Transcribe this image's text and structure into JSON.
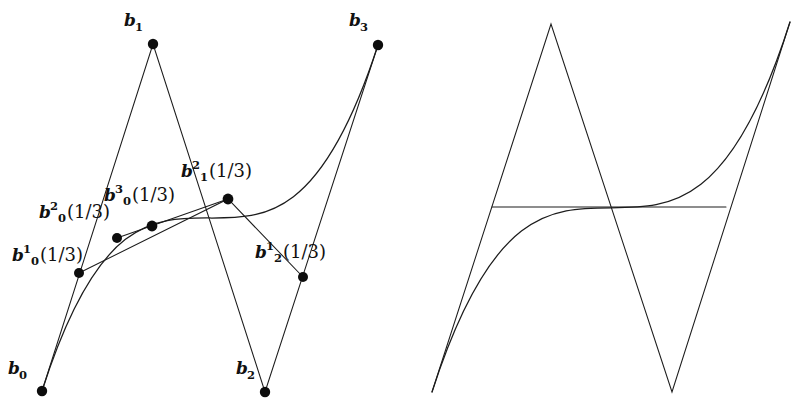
{
  "figure": {
    "background_color": "#ffffff",
    "stroke_color": "#1c1c1c",
    "dot_color": "#0d0d0d",
    "parameter_label": "1/3"
  },
  "left_panel": {
    "name": "labelled-de-casteljau-construction",
    "control_points": [
      {
        "id": "b0",
        "label_base": "b",
        "sub": "0",
        "sup": "",
        "arg": "",
        "x": 42,
        "y": 391
      },
      {
        "id": "b1",
        "label_base": "b",
        "sub": "1",
        "sup": "",
        "arg": "",
        "x": 153,
        "y": 44
      },
      {
        "id": "b2",
        "label_base": "b",
        "sub": "2",
        "sup": "",
        "arg": "",
        "x": 265,
        "y": 392
      },
      {
        "id": "b3",
        "label_base": "b",
        "sub": "3",
        "sup": "",
        "arg": "",
        "x": 378,
        "y": 45
      }
    ],
    "intermediate_points": [
      {
        "id": "b0_1",
        "label_base": "b",
        "sub": "0",
        "sup": "1",
        "arg": "(1/3)",
        "x": 79,
        "y": 273
      },
      {
        "id": "b0_2",
        "label_base": "b",
        "sub": "0",
        "sup": "2",
        "arg": "(1/3)",
        "x": 117,
        "y": 238
      },
      {
        "id": "b0_3",
        "label_base": "b",
        "sub": "0",
        "sup": "3",
        "arg": "(1/3)",
        "x": 152,
        "y": 226
      },
      {
        "id": "b1_2",
        "label_base": "b",
        "sub": "1",
        "sup": "2",
        "arg": "(1/3)",
        "x": 228,
        "y": 199
      },
      {
        "id": "b2_1",
        "label_base": "b",
        "sub": "2",
        "sup": "1",
        "arg": "(1/3)",
        "x": 303,
        "y": 277
      }
    ],
    "labels": {
      "b0": {
        "text": "b0",
        "x": 8,
        "y": 368
      },
      "b1": {
        "text": "b1",
        "x": 124,
        "y": 18
      },
      "b2": {
        "text": "b2",
        "x": 236,
        "y": 366
      },
      "b3": {
        "text": "b3",
        "x": 349,
        "y": 18
      },
      "b0_1": {
        "text": "b0^1(1/3)",
        "x": 12,
        "y": 248
      },
      "b0_2": {
        "text": "b0^2(1/3)",
        "x": 39,
        "y": 205
      },
      "b0_3": {
        "text": "b0^3(1/3)",
        "x": 104,
        "y": 188
      },
      "b1_2": {
        "text": "b1^2(1/3)",
        "x": 181,
        "y": 164
      },
      "b2_1": {
        "text": "b2^1(1/3)",
        "x": 255,
        "y": 245
      }
    }
  },
  "right_panel": {
    "name": "unlabelled-construction-with-chord",
    "control_points": [
      {
        "id": "b0",
        "x": 432,
        "y": 392
      },
      {
        "id": "b1",
        "x": 551,
        "y": 24
      },
      {
        "id": "b2",
        "x": 672,
        "y": 392
      },
      {
        "id": "b3",
        "x": 790,
        "y": 22
      }
    ],
    "chord": {
      "x1": 492,
      "y1": 207,
      "x2": 726,
      "y2": 207
    }
  },
  "chart_data": {
    "type": "line",
    "xlabel": "",
    "ylabel": "",
    "grid": false,
    "legend": "none",
    "series": [
      {
        "name": "control polygon (left)",
        "kind": "polyline",
        "x": [
          42,
          153,
          265,
          378
        ],
        "y": [
          391,
          44,
          392,
          45
        ]
      },
      {
        "name": "first level hull (left)",
        "kind": "polyline",
        "x": [
          79,
          228,
          303
        ],
        "y": [
          273,
          199,
          277
        ]
      },
      {
        "name": "second level hull (left)",
        "kind": "polyline",
        "x": [
          117,
          228
        ],
        "y": [
          238,
          199
        ]
      },
      {
        "name": "bezier curve (left)",
        "kind": "cubic-bezier",
        "p0": [
          42,
          391
        ],
        "p1": [
          153,
          44
        ],
        "p2": [
          265,
          392
        ],
        "p3": [
          378,
          45
        ]
      },
      {
        "name": "control polygon (right)",
        "kind": "polyline",
        "x": [
          432,
          551,
          672,
          790
        ],
        "y": [
          392,
          24,
          392,
          22
        ]
      },
      {
        "name": "bezier curve (right)",
        "kind": "cubic-bezier",
        "p0": [
          432,
          392
        ],
        "p1": [
          551,
          24
        ],
        "p2": [
          672,
          392
        ],
        "p3": [
          790,
          22
        ]
      },
      {
        "name": "chord (right)",
        "kind": "segment",
        "x": [
          492,
          726
        ],
        "y": [
          207,
          207
        ]
      }
    ],
    "annotations": [
      "b0",
      "b1",
      "b2",
      "b3",
      "b0^1(1/3)",
      "b0^2(1/3)",
      "b0^3(1/3)",
      "b1^2(1/3)",
      "b2^1(1/3)"
    ]
  }
}
